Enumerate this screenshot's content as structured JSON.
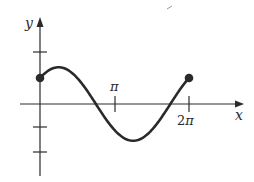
{
  "chart_data": {
    "type": "line",
    "title": "",
    "xlabel": "x",
    "ylabel": "y",
    "function": "y = sin x + cos x",
    "x_tick_labels": [
      "π",
      "2π"
    ],
    "x_ticks": [
      3.14159,
      6.28319
    ],
    "y_ticks": [
      -2,
      -1,
      1
    ],
    "xlim": [
      -0.83,
      7.15
    ],
    "ylim": [
      -2.8,
      3.4
    ],
    "grid": false,
    "legend": null,
    "endpoints": [
      {
        "x": 0,
        "y": 1,
        "marker": "filled-circle"
      },
      {
        "x": 6.28319,
        "y": 1,
        "marker": "filled-circle"
      }
    ],
    "key_points": [
      {
        "label": "max",
        "x": 0.785,
        "y": 1.414
      },
      {
        "label": "zero",
        "x": 2.356,
        "y": 0
      },
      {
        "label": "min",
        "x": 3.927,
        "y": -1.414
      },
      {
        "label": "zero",
        "x": 5.498,
        "y": 0
      }
    ],
    "x": [
      0,
      0.393,
      0.785,
      1.178,
      1.571,
      1.963,
      2.356,
      2.749,
      3.142,
      3.534,
      3.927,
      4.32,
      4.712,
      5.105,
      5.498,
      5.89,
      6.283
    ],
    "values": [
      1.0,
      1.307,
      1.414,
      1.307,
      1.0,
      0.541,
      0.0,
      -0.541,
      -1.0,
      -1.307,
      -1.414,
      -1.307,
      -1.0,
      -0.541,
      0.0,
      0.541,
      1.0
    ]
  },
  "labels": {
    "x_axis": "x",
    "y_axis": "y",
    "pi_tick": "π",
    "two_pi_tick_num": "2",
    "two_pi_tick_pi": "π"
  },
  "colors": {
    "ink": "#2a2a2a",
    "background": "#ffffff"
  }
}
